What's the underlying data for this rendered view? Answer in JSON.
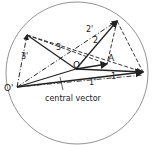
{
  "diagram": {
    "labels": {
      "origin_prime": "O'",
      "origin": "O",
      "point_a": "A",
      "vec1": "1",
      "vec1_prime": "1'",
      "vec2": "2",
      "vec2_prime": "2'",
      "vec3": "3",
      "vec3_prime": "3'",
      "caption": "central vector"
    },
    "colors": {
      "line": "#222222",
      "circle": "#666666"
    }
  }
}
